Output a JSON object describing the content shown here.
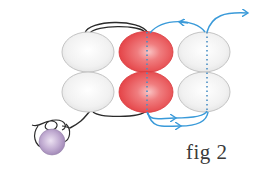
{
  "figure": {
    "caption": "fig 2",
    "colors": {
      "plain_bead_fill": "#f2f2f2",
      "plain_bead_stroke": "#bdbdbd",
      "highlight_bead_fill": "#e8474a",
      "highlight_bead_light": "#f7b0b0",
      "stop_bead_fill": "#b79cc9",
      "thread_previous": "#2b2b2b",
      "thread_current": "#3a9ad9"
    },
    "beads": [
      {
        "id": "top-left",
        "col": 1,
        "row": 1,
        "highlight": false
      },
      {
        "id": "bottom-left",
        "col": 1,
        "row": 2,
        "highlight": false
      },
      {
        "id": "top-middle",
        "col": 2,
        "row": 1,
        "highlight": true
      },
      {
        "id": "bottom-middle",
        "col": 2,
        "row": 2,
        "highlight": true
      },
      {
        "id": "top-right",
        "col": 3,
        "row": 1,
        "highlight": false
      },
      {
        "id": "bottom-right",
        "col": 3,
        "row": 2,
        "highlight": false
      }
    ],
    "stop_bead": {
      "color": "purple",
      "knotted": true
    }
  }
}
